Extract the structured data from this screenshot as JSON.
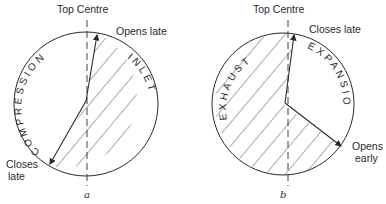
{
  "diagrams": [
    {
      "id": "a",
      "caption": "a",
      "top_label": "Top Centre",
      "upper_label": "Opens late",
      "lower_label_line1": "Closes",
      "lower_label_line2": "late",
      "shaded_region_label": "INLET",
      "open_region_label": "COMPRESSION"
    },
    {
      "id": "b",
      "caption": "b",
      "top_label": "Top Centre",
      "upper_label": "Closes late",
      "lower_label_line1": "Opens",
      "lower_label_line2": "early",
      "shaded_region_label": "EXHAUST",
      "open_region_label": "EXPANSION"
    }
  ],
  "colors": {
    "ink": "#2a2a2a",
    "background": "#ffffff"
  }
}
